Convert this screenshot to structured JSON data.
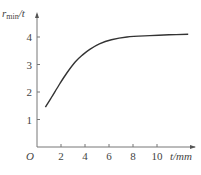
{
  "chart_data": {
    "type": "line",
    "title": "",
    "xlabel": "t/mm",
    "ylabel": "r_min/t",
    "origin_label": "O",
    "xlim": [
      0,
      13
    ],
    "ylim": [
      0,
      4.5
    ],
    "xticks": [
      2,
      4,
      6,
      8,
      10
    ],
    "yticks": [
      1,
      2,
      3,
      4
    ],
    "grid": false,
    "legend": null,
    "series": [
      {
        "name": "r_min/t",
        "x": [
          0.7,
          1.2,
          1.9,
          2.5,
          3.2,
          3.8,
          4.4,
          5.2,
          6.2,
          7.5,
          9.4,
          11.0,
          12.6
        ],
        "y": [
          1.45,
          1.8,
          2.3,
          2.7,
          3.1,
          3.35,
          3.55,
          3.75,
          3.9,
          4.0,
          4.05,
          4.08,
          4.1
        ]
      }
    ]
  }
}
